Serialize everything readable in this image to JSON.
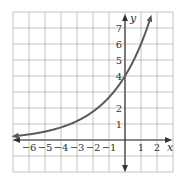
{
  "chart_data": {
    "type": "line",
    "title": "",
    "xlabel": "x",
    "ylabel": "y",
    "xlim": [
      -7,
      3
    ],
    "ylim": [
      -2,
      8
    ],
    "grid": true,
    "x_ticks": [
      "-6",
      "-5",
      "-4",
      "-3",
      "-2",
      "-1",
      "1",
      "2"
    ],
    "y_ticks": [
      "1",
      "2",
      "4",
      "5",
      "6",
      "7"
    ],
    "series": [
      {
        "name": "y = 4(1.5)^x",
        "x": [
          -7,
          -6,
          -5,
          -4,
          -3,
          -2,
          -1,
          0,
          1,
          1.6
        ],
        "y": [
          0.23,
          0.35,
          0.53,
          0.79,
          1.19,
          1.78,
          2.67,
          4,
          6,
          7.6
        ]
      }
    ],
    "annotations": [
      "curve crosses y-axis at 4",
      "arrows at both curve ends"
    ]
  }
}
